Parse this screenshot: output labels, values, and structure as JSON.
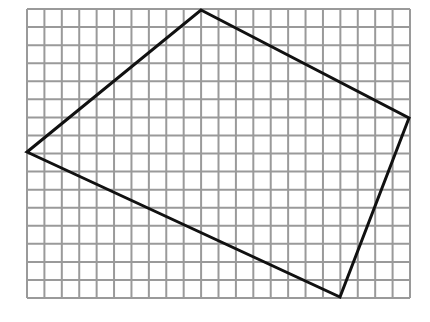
{
  "diagram": {
    "type": "grid-polygon",
    "grid": {
      "x0": 27,
      "y0": 9,
      "x1": 410,
      "y1": 298,
      "cols": 22,
      "rows": 16,
      "line_color": "#9a9a9a",
      "line_width": 2
    },
    "polygon": {
      "shape": "quadrilateral",
      "stroke_color": "#111111",
      "stroke_width": 3,
      "vertices": [
        {
          "name": "top",
          "x": 201,
          "y": 10
        },
        {
          "name": "right",
          "x": 409,
          "y": 118
        },
        {
          "name": "bottom",
          "x": 340,
          "y": 297
        },
        {
          "name": "left",
          "x": 27,
          "y": 152
        }
      ]
    }
  }
}
